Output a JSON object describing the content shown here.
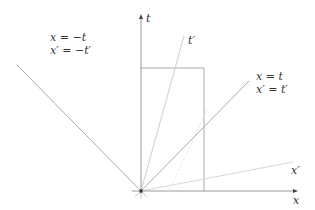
{
  "diagram": {
    "type": "spacetime-diagram",
    "axes": {
      "t_label": "t",
      "x_label": "x",
      "t_prime_label": "t′",
      "x_prime_label": "x′"
    },
    "light_cone_left": {
      "line1": "x = −t",
      "line2": "x′ = −t′"
    },
    "light_cone_right": {
      "line1": "x = t",
      "line2": "x′ = t′"
    },
    "colors": {
      "axis": "#999999",
      "light_line": "#aaaaaa",
      "primed_axis": "#d6d6d6",
      "rectangle": "#aaaaaa",
      "text": "#333333"
    }
  }
}
